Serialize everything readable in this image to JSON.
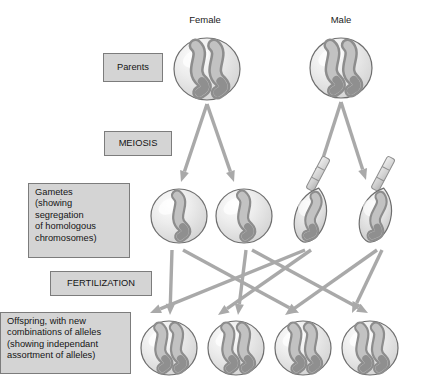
{
  "diagram": {
    "background": "#ffffff",
    "arrow_color": "#a9a9a9",
    "box_fill": "#d4d4d4",
    "box_border": "#7c7c7c",
    "cell_fill": "#e8e8e8",
    "cell_border": "#6e6e6e",
    "chromosome_light": "#bdbdbd",
    "chromosome_dark": "#8a8a8a"
  },
  "headers": [
    {
      "label": "Female",
      "x": 205,
      "y": 14
    },
    {
      "label": "Male",
      "x": 341,
      "y": 14
    }
  ],
  "stage_labels": [
    {
      "name": "parents",
      "lines": [
        "Parents"
      ],
      "x": 103,
      "y": 53,
      "w": 60,
      "h": 29,
      "align": "center"
    },
    {
      "name": "meiosis",
      "lines": [
        "MEIOSIS"
      ],
      "x": 104,
      "y": 131,
      "w": 68,
      "h": 25,
      "align": "center"
    },
    {
      "name": "gametes",
      "lines": [
        "Gametes",
        "(showing",
        "segregation",
        "of homologous",
        "chromosomes)"
      ],
      "x": 28,
      "y": 183,
      "w": 102,
      "h": 75,
      "align": "left"
    },
    {
      "name": "fertilization",
      "lines": [
        "FERTILIZATION"
      ],
      "x": 50,
      "y": 271,
      "w": 102,
      "h": 25,
      "align": "center"
    },
    {
      "name": "offspring",
      "lines": [
        "Offspring, with new",
        "combinations of alleles",
        "(showing independant",
        "assortment of alleles)"
      ],
      "x": 0,
      "y": 312,
      "w": 131,
      "h": 62,
      "align": "left"
    }
  ],
  "cells": {
    "parents": [
      {
        "name": "female-parent-cell",
        "cx": 207,
        "cy": 69,
        "rx": 33,
        "ry": 31,
        "chromosomes": 2
      },
      {
        "name": "male-parent-cell",
        "cx": 341,
        "cy": 68,
        "rx": 31,
        "ry": 30,
        "chromosomes": 2
      }
    ],
    "egg_gametes": [
      {
        "name": "egg-gamete-1",
        "cx": 179,
        "cy": 216,
        "rx": 28,
        "ry": 27,
        "chromosomes": 1
      },
      {
        "name": "egg-gamete-2",
        "cx": 244,
        "cy": 216,
        "rx": 28,
        "ry": 27,
        "chromosomes": 1
      }
    ],
    "sperm_gametes": [
      {
        "name": "sperm-gamete-1",
        "cx": 311,
        "cy": 215,
        "rx": 21,
        "ry": 28,
        "chromosomes": 1
      },
      {
        "name": "sperm-gamete-2",
        "cx": 376,
        "cy": 215,
        "rx": 21,
        "ry": 28,
        "chromosomes": 1
      }
    ],
    "offspring": [
      {
        "name": "offspring-cell-1",
        "cx": 169,
        "cy": 348,
        "rx": 28,
        "ry": 27,
        "chromosomes": 2
      },
      {
        "name": "offspring-cell-2",
        "cx": 236,
        "cy": 348,
        "rx": 28,
        "ry": 27,
        "chromosomes": 2
      },
      {
        "name": "offspring-cell-3",
        "cx": 303,
        "cy": 348,
        "rx": 28,
        "ry": 27,
        "chromosomes": 2
      },
      {
        "name": "offspring-cell-4",
        "cx": 370,
        "cy": 348,
        "rx": 28,
        "ry": 27,
        "chromosomes": 2
      }
    ]
  },
  "arrows": {
    "meiosis": [
      {
        "name": "meiosis-arrow-female-left",
        "x1": 207,
        "y1": 104,
        "x2": 181,
        "y2": 182
      },
      {
        "name": "meiosis-arrow-female-right",
        "x1": 207,
        "y1": 104,
        "x2": 234,
        "y2": 182
      },
      {
        "name": "meiosis-arrow-male-left",
        "x1": 341,
        "y1": 102,
        "x2": 316,
        "y2": 180
      },
      {
        "name": "meiosis-arrow-male-right",
        "x1": 341,
        "y1": 102,
        "x2": 366,
        "y2": 180
      }
    ],
    "fertilization": [
      {
        "name": "fertilization-arrow-egg1-to-offspring1",
        "x1": 172,
        "y1": 250,
        "x2": 170,
        "y2": 315
      },
      {
        "name": "fertilization-arrow-egg1-to-offspring3",
        "x1": 183,
        "y1": 250,
        "x2": 299,
        "y2": 313
      },
      {
        "name": "fertilization-arrow-egg2-to-offspring2",
        "x1": 246,
        "y1": 250,
        "x2": 238,
        "y2": 315
      },
      {
        "name": "fertilization-arrow-egg2-to-offspring4",
        "x1": 252,
        "y1": 250,
        "x2": 368,
        "y2": 313
      },
      {
        "name": "fertilization-arrow-sperm1-to-offspring1",
        "x1": 305,
        "y1": 250,
        "x2": 150,
        "y2": 313
      },
      {
        "name": "fertilization-arrow-sperm1-to-offspring2",
        "x1": 311,
        "y1": 250,
        "x2": 218,
        "y2": 315
      },
      {
        "name": "fertilization-arrow-sperm2-to-offspring3",
        "x1": 377,
        "y1": 250,
        "x2": 285,
        "y2": 315
      },
      {
        "name": "fertilization-arrow-sperm2-to-offspring4",
        "x1": 382,
        "y1": 250,
        "x2": 352,
        "y2": 313
      }
    ]
  }
}
